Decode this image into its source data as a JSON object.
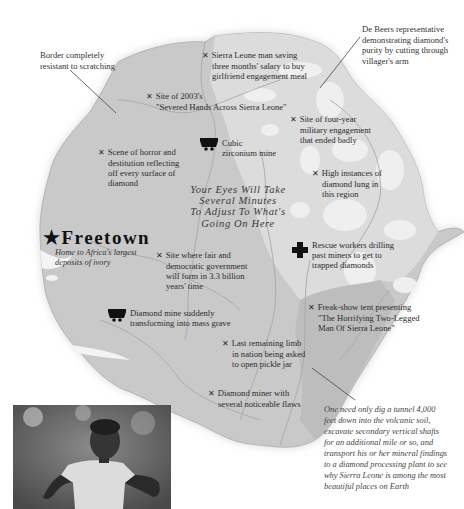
{
  "map": {
    "country": "Sierra Leone",
    "colors": {
      "land_mid": "#c8c8c8",
      "land_light": "#dedede",
      "land_lighter": "#ececec",
      "land_dark": "#b9b9b9",
      "rivers": "#a9a9a9",
      "text": "#2b2b2b"
    },
    "capital": {
      "name": "Freetown",
      "icon": "star-icon",
      "subtitle_line1": "Home to Africa's largest",
      "subtitle_line2": "deposits of ivory"
    },
    "headline": {
      "line1": "Your Eyes Will Take",
      "line2": "Several Minutes",
      "line3": "To Adjust To What's",
      "line4": "Going On Here"
    },
    "outside_callouts": {
      "border": {
        "line1": "Border completely",
        "line2": "resistant to scratching"
      },
      "de_beers": {
        "line1": "De Beers representative",
        "line2": "demonstrating diamond's",
        "line3": "purity by cutting through",
        "line4": "villager's arm"
      },
      "tunnel": {
        "line1": "One need only dig a tunnel 4,000",
        "line2": "feet down into the volcanic soil,",
        "line3": "excavate secondary vertical shafts",
        "line4": "for an additional mile or so, and",
        "line5": "transport his or her mineral findings",
        "line6": "to a diamond processing plant to see",
        "line7": "why Sierra Leone is among the most",
        "line8": "beautiful places on Earth"
      }
    },
    "markers": [
      {
        "icon": "x",
        "line1": "Sierra Leone man saving",
        "line2": "three months' salary to buy",
        "line3": "girlfriend engagement meal"
      },
      {
        "icon": "x",
        "line1": "Site of 2003's",
        "line2": "\"Severed Hands Across Sierra Leone\""
      },
      {
        "icon": "x",
        "line1": "Site of four-year",
        "line2": "military engagement",
        "line3": "that ended badly"
      },
      {
        "icon": "mine",
        "line1": "Cubic",
        "line2": "zirconium mine"
      },
      {
        "icon": "x",
        "line1": "Scene of horror and",
        "line2": "destitution reflecting",
        "line3": "off every surface of",
        "line4": "diamond"
      },
      {
        "icon": "x",
        "line1": "High instances of",
        "line2": "diamond lung in",
        "line3": "this region"
      },
      {
        "icon": "x",
        "line1": "Site where fair and",
        "line2": "democratic government",
        "line3": "will form in 3.3 billion",
        "line4": "years' time"
      },
      {
        "icon": "cross",
        "line1": "Rescue workers drilling",
        "line2": "past miners to get to",
        "line3": "trapped diamonds"
      },
      {
        "icon": "mine",
        "line1": "Diamond mine suddenly",
        "line2": "transforming into mass grave"
      },
      {
        "icon": "x",
        "line1": "Freak-show tent presenting",
        "line2": "\"The Horrifying Two-Legged",
        "line3": "Man Of Sierra Leone\""
      },
      {
        "icon": "x",
        "line1": "Last remaining limb",
        "line2": "in nation being asked",
        "line3": "to open pickle jar"
      },
      {
        "icon": "x",
        "line1": "Diamond miner with",
        "line2": "several noticeable flaws"
      }
    ],
    "x_glyph": "✕",
    "star_glyph": "★"
  },
  "photo": {
    "description": "Black-and-white photo of a person with both hands amputated"
  }
}
